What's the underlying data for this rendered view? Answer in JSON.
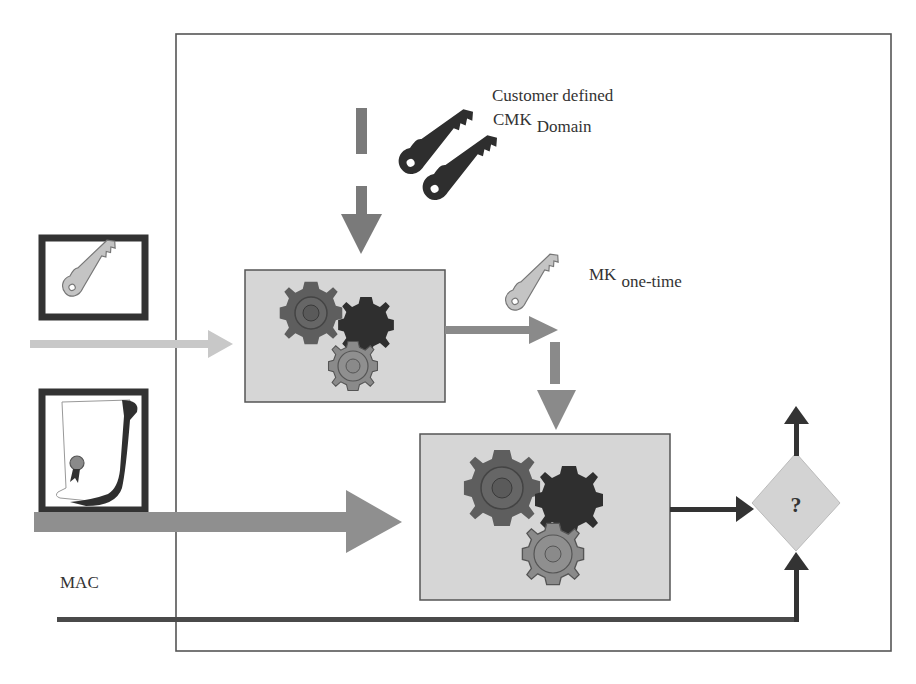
{
  "diagram": {
    "labels": {
      "customer_defined": "Customer defined",
      "cmk_main": "CMK",
      "cmk_sub": "Domain",
      "mk_main": "MK",
      "mk_sub": "one-time",
      "mac": "MAC",
      "decision_symbol": "?"
    },
    "icons": {
      "cmk_keys": "key-pair-icon",
      "input_key": "key-icon",
      "mk_key": "key-icon",
      "document": "certificate-scroll-icon",
      "processor_1": "gears-icon",
      "processor_2": "gears-icon",
      "decision": "diamond-decision"
    },
    "colors": {
      "frame": "#555555",
      "process_box_fill": "#d6d6d6",
      "process_box_border": "#555555",
      "arrow_dark": "#333333",
      "arrow_mid": "#8a8a8a",
      "arrow_light": "#c8c8c8",
      "gear_dark": "#3a3a3a",
      "gear_mid": "#5e5e5e",
      "gear_light": "#8c8c8c",
      "diamond_fill": "#d3d3d3"
    }
  }
}
